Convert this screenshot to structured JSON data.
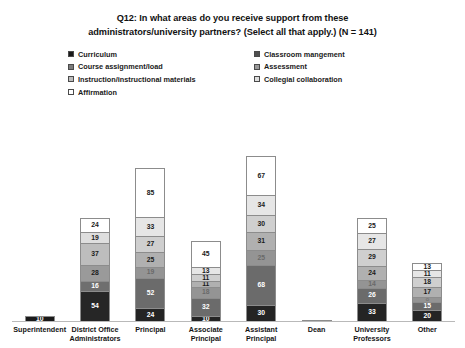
{
  "title": {
    "line1": "Q12: In what areas do you receive support from these",
    "line2": "administrators/university partners? (Select all that apply.) (N = 141)"
  },
  "legend": {
    "position": "top",
    "items": [
      {
        "label": "Curriculum",
        "color": "#1a1a1a"
      },
      {
        "label": "Classroom mangement",
        "color": "#4f4f4f"
      },
      {
        "label": "Course assignment/load",
        "color": "#7b7b7b"
      },
      {
        "label": "Assessment",
        "color": "#9a9a9a"
      },
      {
        "label": "Instruction/instructional materials",
        "color": "#bdbdbd"
      },
      {
        "label": "Collegial collaboration",
        "color": "#dedede"
      },
      {
        "label": "Affirmation",
        "color": "#ffffff"
      }
    ]
  },
  "chart_data": {
    "type": "bar",
    "subtype": "stacked-column",
    "title": "Q12: In what areas do you receive support from these administrators/university partners? (Select all that apply.) (N = 141)",
    "xlabel": "",
    "ylabel": "",
    "grid": false,
    "n": 141,
    "categories": [
      "Superintendent",
      "District Office Administrators",
      "Principal",
      "Associate Principal",
      "Assistant Principal",
      "Dean",
      "University Professors",
      "Other"
    ],
    "series": [
      {
        "name": "Curriculum",
        "color": "#1a1a1a",
        "values": [
          10,
          54,
          24,
          10,
          30,
          2,
          33,
          20
        ]
      },
      {
        "name": "Classroom mangement",
        "color": "#4f4f4f",
        "values": [
          0,
          16,
          52,
          32,
          68,
          0,
          26,
          15
        ]
      },
      {
        "name": "Course assignment/load",
        "color": "#7b7b7b",
        "values": [
          0,
          28,
          19,
          18,
          25,
          0,
          14,
          8
        ]
      },
      {
        "name": "Assessment",
        "color": "#9a9a9a",
        "values": [
          0,
          37,
          25,
          11,
          31,
          0,
          24,
          17
        ]
      },
      {
        "name": "Instruction/instructional materials",
        "color": "#bdbdbd",
        "values": [
          0,
          19,
          27,
          11,
          30,
          0,
          29,
          18
        ]
      },
      {
        "name": "Collegial collaboration",
        "color": "#dedede",
        "values": [
          0,
          24,
          33,
          13,
          34,
          0,
          27,
          11
        ]
      },
      {
        "name": "Affirmation",
        "color": "#ffffff",
        "values": [
          0,
          0,
          85,
          45,
          67,
          0,
          25,
          13
        ]
      }
    ],
    "bars": [
      {
        "category": "Superintendent",
        "segments": [
          {
            "series": "Curriculum",
            "value": 10,
            "label": "10",
            "color": "#1a1a1a",
            "text_color": "#ffffff"
          }
        ]
      },
      {
        "category": "District Office Administrators",
        "segments": [
          {
            "series": "Collegial collaboration",
            "value": 24,
            "label": "24",
            "color": "#ffffff",
            "text_color": "#1a1a1a"
          },
          {
            "series": "Instruction/instructional materials",
            "value": 19,
            "label": "19",
            "color": "#dedede",
            "text_color": "#1a1a1a"
          },
          {
            "series": "Assessment",
            "value": 37,
            "label": "37",
            "color": "#bdbdbd",
            "text_color": "#1a1a1a"
          },
          {
            "series": "Course assignment/load",
            "value": 28,
            "label": "28",
            "color": "#9a9a9a",
            "text_color": "#1a1a1a"
          },
          {
            "series": "Classroom mangement",
            "value": 16,
            "label": "16",
            "color": "#6f6f6f",
            "text_color": "#ffffff"
          },
          {
            "series": "Curriculum",
            "value": 54,
            "label": "54",
            "color": "#262626",
            "text_color": "#ffffff"
          }
        ]
      },
      {
        "category": "Principal",
        "segments": [
          {
            "series": "Affirmation",
            "value": 85,
            "label": "85",
            "color": "#ffffff",
            "text_color": "#1a1a1a"
          },
          {
            "series": "Collegial collaboration",
            "value": 33,
            "label": "33",
            "color": "#e6e6e6",
            "text_color": "#1a1a1a"
          },
          {
            "series": "Instruction/instructional materials",
            "value": 27,
            "label": "27",
            "color": "#cfcfcf",
            "text_color": "#1a1a1a"
          },
          {
            "series": "Assessment",
            "value": 25,
            "label": "25",
            "color": "#b0b0b0",
            "text_color": "#1a1a1a"
          },
          {
            "series": "Course assignment/load",
            "value": 19,
            "label": "19",
            "color": "#949494",
            "text_color": "#6a6a6a"
          },
          {
            "series": "Classroom mangement",
            "value": 52,
            "label": "52",
            "color": "#6b6b6b",
            "text_color": "#ffffff"
          },
          {
            "series": "Curriculum",
            "value": 24,
            "label": "24",
            "color": "#242424",
            "text_color": "#ffffff"
          }
        ]
      },
      {
        "category": "Associate Principal",
        "segments": [
          {
            "series": "Affirmation",
            "value": 45,
            "label": "45",
            "color": "#ffffff",
            "text_color": "#1a1a1a"
          },
          {
            "series": "Collegial collaboration",
            "value": 13,
            "label": "13",
            "color": "#e6e6e6",
            "text_color": "#1a1a1a"
          },
          {
            "series": "Instruction/instructional materials",
            "value": 11,
            "label": "11",
            "color": "#cfcfcf",
            "text_color": "#1a1a1a"
          },
          {
            "series": "Assessment",
            "value": 11,
            "label": "11",
            "color": "#b0b0b0",
            "text_color": "#1a1a1a"
          },
          {
            "series": "Course assignment/load",
            "value": 18,
            "label": "18",
            "color": "#949494",
            "text_color": "#6a6a6a"
          },
          {
            "series": "Classroom mangement",
            "value": 32,
            "label": "32",
            "color": "#6b6b6b",
            "text_color": "#ffffff"
          },
          {
            "series": "Curriculum",
            "value": 10,
            "label": "10",
            "color": "#242424",
            "text_color": "#ffffff"
          }
        ]
      },
      {
        "category": "Assistant Principal",
        "segments": [
          {
            "series": "Affirmation",
            "value": 67,
            "label": "67",
            "color": "#ffffff",
            "text_color": "#1a1a1a"
          },
          {
            "series": "Collegial collaboration",
            "value": 34,
            "label": "34",
            "color": "#e6e6e6",
            "text_color": "#1a1a1a"
          },
          {
            "series": "Instruction/instructional materials",
            "value": 30,
            "label": "30",
            "color": "#cfcfcf",
            "text_color": "#1a1a1a"
          },
          {
            "series": "Assessment",
            "value": 31,
            "label": "31",
            "color": "#b0b0b0",
            "text_color": "#1a1a1a"
          },
          {
            "series": "Course assignment/load",
            "value": 25,
            "label": "25",
            "color": "#949494",
            "text_color": "#6a6a6a"
          },
          {
            "series": "Classroom mangement",
            "value": 68,
            "label": "68",
            "color": "#6b6b6b",
            "text_color": "#ffffff"
          },
          {
            "series": "Curriculum",
            "value": 30,
            "label": "30",
            "color": "#242424",
            "text_color": "#ffffff"
          }
        ]
      },
      {
        "category": "Dean",
        "segments": [
          {
            "series": "Curriculum",
            "value": 2,
            "label": "",
            "color": "#3a3a3a",
            "text_color": "#ffffff"
          }
        ]
      },
      {
        "category": "University Professors",
        "segments": [
          {
            "series": "Affirmation",
            "value": 25,
            "label": "25",
            "color": "#ffffff",
            "text_color": "#1a1a1a"
          },
          {
            "series": "Collegial collaboration",
            "value": 27,
            "label": "27",
            "color": "#e6e6e6",
            "text_color": "#1a1a1a"
          },
          {
            "series": "Instruction/instructional materials",
            "value": 29,
            "label": "29",
            "color": "#cfcfcf",
            "text_color": "#1a1a1a"
          },
          {
            "series": "Assessment",
            "value": 24,
            "label": "24",
            "color": "#b0b0b0",
            "text_color": "#1a1a1a"
          },
          {
            "series": "Course assignment/load",
            "value": 14,
            "label": "14",
            "color": "#949494",
            "text_color": "#6a6a6a"
          },
          {
            "series": "Classroom mangement",
            "value": 26,
            "label": "26",
            "color": "#6b6b6b",
            "text_color": "#ffffff"
          },
          {
            "series": "Curriculum",
            "value": 33,
            "label": "33",
            "color": "#242424",
            "text_color": "#ffffff"
          }
        ]
      },
      {
        "category": "Other",
        "segments": [
          {
            "series": "Affirmation",
            "value": 13,
            "label": "13",
            "color": "#ffffff",
            "text_color": "#1a1a1a"
          },
          {
            "series": "Collegial collaboration",
            "value": 11,
            "label": "11",
            "color": "#e6e6e6",
            "text_color": "#1a1a1a"
          },
          {
            "series": "Instruction/instructional materials",
            "value": 18,
            "label": "18",
            "color": "#cfcfcf",
            "text_color": "#1a1a1a"
          },
          {
            "series": "Assessment",
            "value": 17,
            "label": "17",
            "color": "#b0b0b0",
            "text_color": "#1a1a1a"
          },
          {
            "series": "Course assignment/load",
            "value": 8,
            "label": "8",
            "color": "#949494",
            "text_color": "#7d7d7d"
          },
          {
            "series": "Classroom mangement",
            "value": 15,
            "label": "15",
            "color": "#6b6b6b",
            "text_color": "#ffffff"
          },
          {
            "series": "Curriculum",
            "value": 20,
            "label": "20",
            "color": "#242424",
            "text_color": "#ffffff"
          }
        ]
      }
    ]
  }
}
